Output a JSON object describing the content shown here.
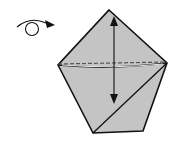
{
  "diagram": {
    "type": "origami-step",
    "symbols": [
      {
        "name": "turn-over-symbol",
        "description": "curved arrow looping around a circle, indicating turn model over"
      },
      {
        "name": "fold-and-unfold-arrow",
        "description": "double-headed vertical arrow from top apex down"
      }
    ],
    "shape": "pentagon",
    "lines": [
      "valley-fold dashed horizontal line",
      "diagonal crease from bottom-left to right vertex"
    ],
    "colors": {
      "paper": "#c4c4c4",
      "outline": "#111111",
      "background": "#ffffff"
    }
  }
}
